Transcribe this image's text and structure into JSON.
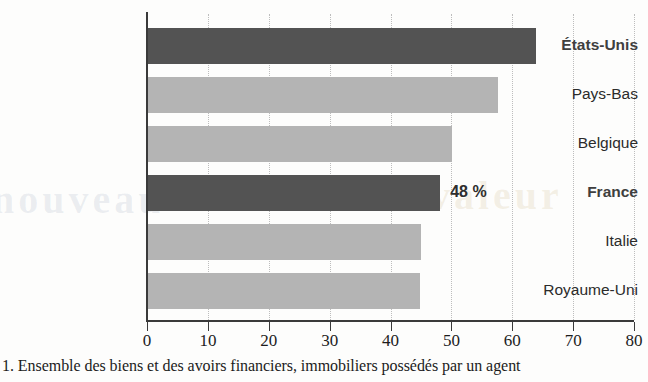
{
  "chart_data": {
    "type": "bar",
    "orientation": "horizontal",
    "title": "",
    "subtitle": "",
    "xlabel": "",
    "ylabel": "",
    "xlim": [
      0,
      80
    ],
    "xticks": [
      0,
      10,
      20,
      30,
      40,
      50,
      60,
      70,
      80
    ],
    "xtick_labels": [
      "0",
      "10",
      "20",
      "30",
      "40",
      "50",
      "60",
      "70",
      "80"
    ],
    "grid": "vertical-dotted",
    "legend": "none",
    "categories": [
      "États-Unis",
      "Pays-Bas",
      "Belgique",
      "France",
      "Italie",
      "Royaume-Uni"
    ],
    "values": [
      63.8,
      57.5,
      50.0,
      48.0,
      44.9,
      44.6
    ],
    "highlighted": [
      "États-Unis",
      "France"
    ],
    "bars": [
      {
        "label": "États-Unis",
        "value": 63.8,
        "style": "dark",
        "bold_label": true,
        "data_label": ""
      },
      {
        "label": "Pays-Bas",
        "value": 57.5,
        "style": "light",
        "bold_label": false,
        "data_label": ""
      },
      {
        "label": "Belgique",
        "value": 50.0,
        "style": "light",
        "bold_label": false,
        "data_label": ""
      },
      {
        "label": "France",
        "value": 48.0,
        "style": "dark",
        "bold_label": true,
        "data_label": "48 %"
      },
      {
        "label": "Italie",
        "value": 44.9,
        "style": "light",
        "bold_label": false,
        "data_label": ""
      },
      {
        "label": "Royaume-Uni",
        "value": 44.6,
        "style": "light",
        "bold_label": false,
        "data_label": ""
      }
    ],
    "annotations": [
      {
        "text": "48 %",
        "attached_to": "France"
      }
    ]
  },
  "colors": {
    "bar_dark": "#535353",
    "bar_light": "#b4b4b4",
    "axis": "#3a3a3a",
    "gridline": "#bdbdbd",
    "text": "#1c1c1c",
    "background": "#fdfdfc"
  },
  "footnote": {
    "text": "1. Ensemble des biens et des avoirs financiers, immobiliers possédés par un agent"
  },
  "bleed": {
    "left": "nouveau",
    "right": "valeur",
    "mid": "tableau"
  }
}
